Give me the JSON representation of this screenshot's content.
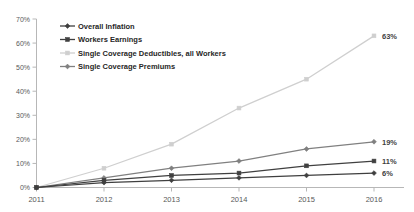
{
  "chart_data": {
    "type": "line",
    "title": "",
    "xlabel": "",
    "ylabel": "",
    "categories": [
      "2011",
      "2012",
      "2013",
      "2014",
      "2015",
      "2016"
    ],
    "x": [
      2011,
      2012,
      2013,
      2014,
      2015,
      2016
    ],
    "ylim": [
      0,
      70
    ],
    "yticks": [
      0,
      10,
      20,
      30,
      40,
      50,
      60,
      70
    ],
    "ytick_labels": [
      "0%",
      "10%",
      "20%",
      "30%",
      "40%",
      "50%",
      "60%",
      "70%"
    ],
    "grid": false,
    "legend_position": "top-left",
    "series": [
      {
        "name": "Overall Inflation",
        "values": [
          0,
          2,
          3,
          4,
          5,
          6
        ],
        "end_label": "6%",
        "color": "#3f3f3f",
        "marker": "diamond"
      },
      {
        "name": "Workers Earnings",
        "values": [
          0,
          3,
          5,
          6,
          9,
          11
        ],
        "end_label": "11%",
        "color": "#404040",
        "marker": "square"
      },
      {
        "name": "Single Coverage Deductibles, all Workers",
        "values": [
          0,
          8,
          18,
          33,
          45,
          63
        ],
        "end_label": "63%",
        "color": "#cfcfcf",
        "marker": "square"
      },
      {
        "name": "Single Coverage Premiums",
        "values": [
          0,
          4,
          8,
          11,
          16,
          19
        ],
        "end_label": "19%",
        "color": "#808080",
        "marker": "diamond"
      }
    ]
  }
}
